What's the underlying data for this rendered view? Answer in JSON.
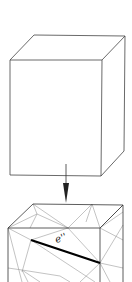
{
  "figure": {
    "type": "diagram",
    "top_cube": {
      "label": ""
    },
    "arrow": {
      "direction": "down"
    },
    "bottom_cube": {
      "highlighted_edge_label": "e''",
      "highlight_color": "#000000",
      "mesh_color": "#9a9a9a"
    }
  }
}
